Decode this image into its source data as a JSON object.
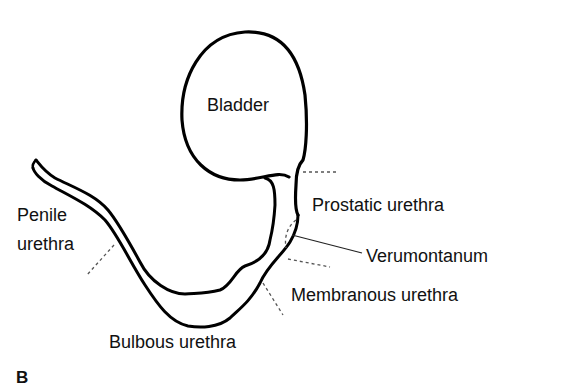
{
  "figure": {
    "panel_letter": "B",
    "labels": {
      "bladder": "Bladder",
      "penile_line1": "Penile",
      "penile_line2": "urethra",
      "prostatic": "Prostatic urethra",
      "verumontanum": "Verumontanum",
      "membranous": "Membranous urethra",
      "bulbous": "Bulbous urethra"
    },
    "colors": {
      "outline": "#000000",
      "text": "#111111",
      "dashed": "#555555",
      "background": "#ffffff"
    }
  }
}
